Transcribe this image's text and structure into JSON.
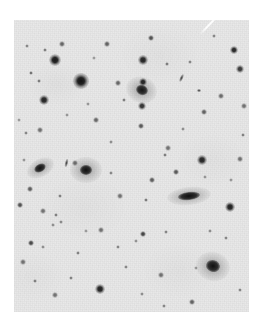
{
  "view": {
    "kind": "astronomical-sky-image",
    "description": "Inverted greyscale optical sky survey field: dark point sources (stars) and several extended galaxies on a light grey background",
    "canvas_width": 264,
    "canvas_height": 328,
    "page_background": "#ffffff"
  },
  "plate": {
    "left": 14,
    "top": 20,
    "width": 235,
    "height": 292,
    "sky_background": "#e9e9e9",
    "source_color": "#111111",
    "halo_color": "#9a9a9a",
    "artifact_color": "#fdfdfd"
  },
  "artifacts": [
    {
      "name": "plate-scratch",
      "x": 196,
      "y": 24,
      "length": 26,
      "angle": -46,
      "thickness": 2
    }
  ],
  "galaxies": [
    {
      "name": "galaxy-upper-right-diffuse",
      "x": 142,
      "y": 90,
      "rx": 12,
      "ry": 10,
      "angle": 20,
      "core_rx": 6,
      "core_ry": 5,
      "darkness": 0.93
    },
    {
      "name": "galaxy-left-elongated",
      "x": 40,
      "y": 168,
      "rx": 11,
      "ry": 7,
      "angle": -28,
      "core_rx": 6,
      "core_ry": 4,
      "darkness": 0.95
    },
    {
      "name": "galaxy-left-round",
      "x": 86,
      "y": 170,
      "rx": 12,
      "ry": 10,
      "angle": 0,
      "core_rx": 6,
      "core_ry": 5,
      "darkness": 0.96
    },
    {
      "name": "galaxy-central-edge-on",
      "x": 189,
      "y": 196,
      "rx": 17,
      "ry": 7,
      "angle": -6,
      "core_rx": 11,
      "core_ry": 4,
      "darkness": 0.97
    },
    {
      "name": "galaxy-lower-right-nucleated",
      "x": 213,
      "y": 266,
      "rx": 13,
      "ry": 11,
      "angle": 15,
      "core_rx": 7,
      "core_ry": 6,
      "darkness": 0.96
    }
  ],
  "edge_on_streaks": [
    {
      "name": "streak-left-of-round-galaxy",
      "x": 66,
      "y": 163,
      "w": 3,
      "h": 8,
      "angle": 12
    },
    {
      "name": "streak-upper-right-faint",
      "x": 181,
      "y": 78,
      "w": 3,
      "h": 8,
      "angle": 25
    },
    {
      "name": "streak-upper-right-small",
      "x": 199,
      "y": 90,
      "w": 4,
      "h": 3,
      "angle": 0
    }
  ],
  "stars": [
    {
      "x": 81,
      "y": 81,
      "r": 5.2,
      "i": 0.97
    },
    {
      "x": 55,
      "y": 60,
      "r": 4.2,
      "i": 0.95
    },
    {
      "x": 44,
      "y": 100,
      "r": 3.4,
      "i": 0.9
    },
    {
      "x": 143,
      "y": 82,
      "r": 3.0,
      "i": 0.88
    },
    {
      "x": 143,
      "y": 60,
      "r": 3.2,
      "i": 0.9
    },
    {
      "x": 234,
      "y": 50,
      "r": 3.0,
      "i": 0.88
    },
    {
      "x": 240,
      "y": 69,
      "r": 2.6,
      "i": 0.8
    },
    {
      "x": 151,
      "y": 38,
      "r": 2.0,
      "i": 0.7
    },
    {
      "x": 107,
      "y": 44,
      "r": 1.8,
      "i": 0.62
    },
    {
      "x": 62,
      "y": 44,
      "r": 1.8,
      "i": 0.6
    },
    {
      "x": 45,
      "y": 50,
      "r": 1.6,
      "i": 0.5
    },
    {
      "x": 27,
      "y": 46,
      "r": 1.5,
      "i": 0.45
    },
    {
      "x": 39,
      "y": 81,
      "r": 1.6,
      "i": 0.5
    },
    {
      "x": 31,
      "y": 73,
      "r": 1.7,
      "i": 0.55
    },
    {
      "x": 118,
      "y": 83,
      "r": 1.8,
      "i": 0.6
    },
    {
      "x": 124,
      "y": 100,
      "r": 1.6,
      "i": 0.5
    },
    {
      "x": 142,
      "y": 106,
      "r": 2.6,
      "i": 0.82
    },
    {
      "x": 141,
      "y": 126,
      "r": 2.0,
      "i": 0.66
    },
    {
      "x": 96,
      "y": 120,
      "r": 1.8,
      "i": 0.6
    },
    {
      "x": 167,
      "y": 64,
      "r": 1.6,
      "i": 0.5
    },
    {
      "x": 190,
      "y": 62,
      "r": 1.5,
      "i": 0.45
    },
    {
      "x": 214,
      "y": 36,
      "r": 1.5,
      "i": 0.45
    },
    {
      "x": 221,
      "y": 96,
      "r": 1.8,
      "i": 0.58
    },
    {
      "x": 204,
      "y": 112,
      "r": 2.0,
      "i": 0.62
    },
    {
      "x": 244,
      "y": 106,
      "r": 1.8,
      "i": 0.55
    },
    {
      "x": 176,
      "y": 172,
      "r": 2.0,
      "i": 0.66
    },
    {
      "x": 202,
      "y": 160,
      "r": 3.2,
      "i": 0.9
    },
    {
      "x": 240,
      "y": 159,
      "r": 1.8,
      "i": 0.56
    },
    {
      "x": 230,
      "y": 207,
      "r": 3.6,
      "i": 0.92
    },
    {
      "x": 243,
      "y": 135,
      "r": 1.6,
      "i": 0.48
    },
    {
      "x": 168,
      "y": 148,
      "r": 1.8,
      "i": 0.55
    },
    {
      "x": 165,
      "y": 155,
      "r": 1.6,
      "i": 0.5
    },
    {
      "x": 152,
      "y": 180,
      "r": 2.0,
      "i": 0.64
    },
    {
      "x": 146,
      "y": 200,
      "r": 1.7,
      "i": 0.52
    },
    {
      "x": 120,
      "y": 196,
      "r": 1.8,
      "i": 0.55
    },
    {
      "x": 111,
      "y": 173,
      "r": 1.5,
      "i": 0.45
    },
    {
      "x": 75,
      "y": 163,
      "r": 1.8,
      "i": 0.55
    },
    {
      "x": 40,
      "y": 130,
      "r": 1.8,
      "i": 0.56
    },
    {
      "x": 26,
      "y": 133,
      "r": 1.5,
      "i": 0.45
    },
    {
      "x": 30,
      "y": 189,
      "r": 2.0,
      "i": 0.64
    },
    {
      "x": 20,
      "y": 205,
      "r": 2.2,
      "i": 0.7
    },
    {
      "x": 43,
      "y": 211,
      "r": 1.8,
      "i": 0.55
    },
    {
      "x": 60,
      "y": 196,
      "r": 1.6,
      "i": 0.48
    },
    {
      "x": 56,
      "y": 215,
      "r": 1.6,
      "i": 0.48
    },
    {
      "x": 61,
      "y": 222,
      "r": 1.5,
      "i": 0.44
    },
    {
      "x": 31,
      "y": 243,
      "r": 2.4,
      "i": 0.74
    },
    {
      "x": 53,
      "y": 225,
      "r": 1.5,
      "i": 0.42
    },
    {
      "x": 23,
      "y": 262,
      "r": 1.8,
      "i": 0.55
    },
    {
      "x": 35,
      "y": 281,
      "r": 1.6,
      "i": 0.48
    },
    {
      "x": 55,
      "y": 295,
      "r": 1.8,
      "i": 0.55
    },
    {
      "x": 71,
      "y": 278,
      "r": 1.6,
      "i": 0.48
    },
    {
      "x": 43,
      "y": 247,
      "r": 1.5,
      "i": 0.42
    },
    {
      "x": 100,
      "y": 289,
      "r": 3.4,
      "i": 0.92
    },
    {
      "x": 78,
      "y": 253,
      "r": 1.6,
      "i": 0.48
    },
    {
      "x": 101,
      "y": 230,
      "r": 1.8,
      "i": 0.55
    },
    {
      "x": 118,
      "y": 247,
      "r": 1.6,
      "i": 0.46
    },
    {
      "x": 126,
      "y": 267,
      "r": 1.6,
      "i": 0.46
    },
    {
      "x": 143,
      "y": 234,
      "r": 2.4,
      "i": 0.76
    },
    {
      "x": 166,
      "y": 232,
      "r": 1.6,
      "i": 0.46
    },
    {
      "x": 161,
      "y": 275,
      "r": 1.8,
      "i": 0.55
    },
    {
      "x": 136,
      "y": 241,
      "r": 1.4,
      "i": 0.4
    },
    {
      "x": 192,
      "y": 302,
      "r": 2.0,
      "i": 0.62
    },
    {
      "x": 164,
      "y": 306,
      "r": 1.6,
      "i": 0.46
    },
    {
      "x": 142,
      "y": 294,
      "r": 1.5,
      "i": 0.42
    },
    {
      "x": 226,
      "y": 238,
      "r": 1.6,
      "i": 0.46
    },
    {
      "x": 240,
      "y": 290,
      "r": 1.6,
      "i": 0.46
    },
    {
      "x": 210,
      "y": 231,
      "r": 1.5,
      "i": 0.42
    },
    {
      "x": 183,
      "y": 129,
      "r": 1.5,
      "i": 0.42
    },
    {
      "x": 111,
      "y": 142,
      "r": 1.5,
      "i": 0.42
    },
    {
      "x": 88,
      "y": 104,
      "r": 1.4,
      "i": 0.38
    },
    {
      "x": 67,
      "y": 115,
      "r": 1.4,
      "i": 0.38
    },
    {
      "x": 205,
      "y": 177,
      "r": 1.4,
      "i": 0.38
    },
    {
      "x": 231,
      "y": 180,
      "r": 1.4,
      "i": 0.38
    },
    {
      "x": 24,
      "y": 160,
      "r": 1.4,
      "i": 0.38
    },
    {
      "x": 19,
      "y": 120,
      "r": 1.4,
      "i": 0.36
    },
    {
      "x": 94,
      "y": 58,
      "r": 1.4,
      "i": 0.36
    },
    {
      "x": 196,
      "y": 268,
      "r": 1.4,
      "i": 0.36
    },
    {
      "x": 86,
      "y": 231,
      "r": 1.4,
      "i": 0.36
    }
  ]
}
